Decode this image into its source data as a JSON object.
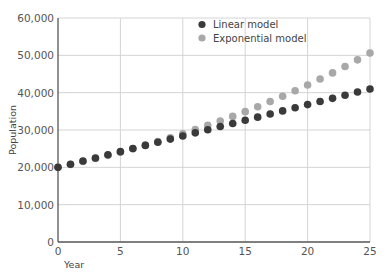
{
  "chart_data": {
    "type": "scatter",
    "title": "",
    "xlabel": "Year",
    "ylabel": "Population",
    "xlim": [
      0,
      25
    ],
    "ylim": [
      0,
      60000
    ],
    "grid": true,
    "legend_position": "top-center-right",
    "x_ticks": [
      "0",
      "5",
      "10",
      "15",
      "20",
      "25"
    ],
    "y_ticks": [
      "0",
      "10,000",
      "20,000",
      "30,000",
      "40,000",
      "50,000",
      "60,000"
    ],
    "x": [
      0,
      1,
      2,
      3,
      4,
      5,
      6,
      7,
      8,
      9,
      10,
      11,
      12,
      13,
      14,
      15,
      16,
      17,
      18,
      19,
      20,
      21,
      22,
      23,
      24,
      25
    ],
    "series": [
      {
        "name": "Linear model",
        "color": "#3a3a3a",
        "values": [
          20000,
          20840,
          21680,
          22520,
          23360,
          24200,
          25040,
          25880,
          26720,
          27560,
          28400,
          29240,
          30080,
          30920,
          31760,
          32600,
          33440,
          34280,
          35120,
          35960,
          36800,
          37640,
          38480,
          39320,
          40160,
          41000
        ]
      },
      {
        "name": "Exponential model",
        "color": "#a8a8a8",
        "values": [
          20000,
          20757,
          21543,
          22358,
          23205,
          24083,
          24995,
          25941,
          26923,
          27942,
          29000,
          30098,
          31237,
          32420,
          33647,
          34921,
          36243,
          37615,
          39039,
          40516,
          42050,
          43642,
          45294,
          47009,
          48788,
          50635
        ]
      }
    ]
  }
}
